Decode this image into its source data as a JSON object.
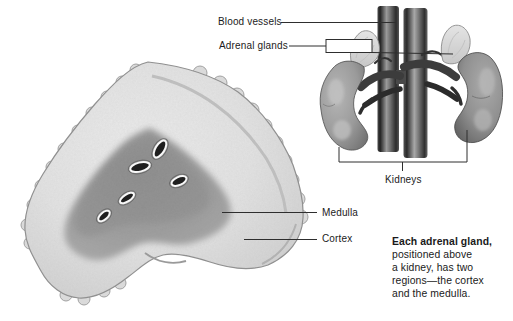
{
  "figure_title": "Adrenal gland and kidney anatomy diagram",
  "callouts": {
    "blood_vessels": "Blood vessels",
    "adrenal_glands": "Adrenal glands",
    "kidneys": "Kidneys",
    "medulla": "Medulla",
    "cortex": "Cortex"
  },
  "caption": {
    "lead": "Each adrenal gland,",
    "lines": [
      "positioned above",
      "a kidney, has two",
      "regions—the cortex",
      "and the medulla."
    ]
  },
  "illustration": {
    "cross_section": {
      "regions": [
        "cortex",
        "medulla"
      ],
      "medulla_vessel_count": 5
    },
    "colors": {
      "background": "#ffffff",
      "text": "#1b1b1b",
      "leader_line": "#2e2e2e",
      "cortex_light": "#e2e2e2",
      "medulla_gray": "#9b9b9b",
      "kidney_gray": "#8f8f8f",
      "vessel_dark": "#262626",
      "adrenal_cap": "#d8d8d8"
    }
  }
}
